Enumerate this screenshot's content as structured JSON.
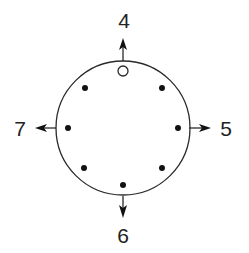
{
  "diagram": {
    "colors": {
      "stroke": "#2a2a2a",
      "dot": "#111111",
      "background": "#ffffff"
    },
    "circle": {
      "cx": 123,
      "cy": 128,
      "r": 67
    },
    "labels": {
      "top": "4",
      "right": "5",
      "bottom": "6",
      "left": "7"
    },
    "arrows": [
      {
        "direction": "up",
        "label": "4"
      },
      {
        "direction": "right",
        "label": "5"
      },
      {
        "direction": "down",
        "label": "6"
      },
      {
        "direction": "left",
        "label": "7"
      }
    ],
    "points": [
      {
        "position": "top",
        "type": "open"
      },
      {
        "position": "top-right",
        "type": "filled"
      },
      {
        "position": "right",
        "type": "filled"
      },
      {
        "position": "bottom-right",
        "type": "filled"
      },
      {
        "position": "bottom",
        "type": "filled"
      },
      {
        "position": "bottom-left",
        "type": "filled"
      },
      {
        "position": "left",
        "type": "filled"
      },
      {
        "position": "top-left",
        "type": "filled"
      }
    ]
  }
}
